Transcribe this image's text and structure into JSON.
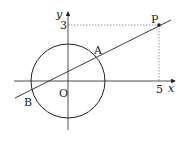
{
  "diagram": {
    "axes": {
      "x_label": "x",
      "y_label": "y"
    },
    "origin_label": "O",
    "ticks": {
      "x_value": "5",
      "y_value": "3"
    },
    "points": [
      {
        "name": "P",
        "label": "P",
        "coords": [
          5,
          3
        ]
      },
      {
        "name": "A",
        "label": "A"
      },
      {
        "name": "B",
        "label": "B"
      }
    ],
    "circle": {
      "center": "O"
    },
    "line": {
      "through": [
        "B",
        "A",
        "P"
      ]
    },
    "colors": {
      "stroke": "#222222",
      "dashed": "#555555"
    }
  }
}
